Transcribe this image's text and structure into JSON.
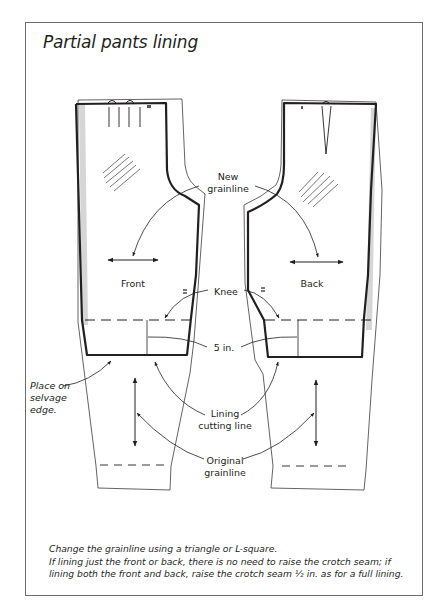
{
  "title": "Partial pants lining",
  "labels": {
    "front": "Front",
    "back": "Back",
    "new_grainline": [
      "New",
      "grainline"
    ],
    "knee": "Knee",
    "five_in": "5 in.",
    "lining_cutting_line": [
      "Lining",
      "cutting line"
    ],
    "original_grainline": [
      "Original",
      "grainline"
    ],
    "selvage": [
      "Place on",
      "selvage",
      "edge."
    ]
  },
  "caption": {
    "line1": "Change the grainline using a triangle or L-square.",
    "line2": "If lining just the front or back, there is no need to raise the crotch seam; if",
    "line3": "lining both the front and back, raise the crotch seam ½ in. as for a full lining."
  },
  "colors": {
    "line": "#231f20",
    "frame": "#6b6b6b",
    "shadow": "#c8c8c8"
  }
}
